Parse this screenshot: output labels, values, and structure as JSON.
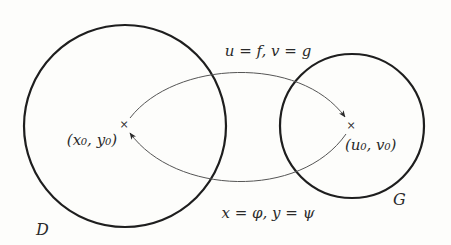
{
  "diagram": {
    "colors": {
      "background": "#fdfdfb",
      "stroke": "#1e1e1e",
      "arc": "#555555",
      "text": "#2a2a2a"
    },
    "regions": [
      {
        "id": "D",
        "label": "D",
        "cx": 125,
        "cy": 126,
        "r": 101
      },
      {
        "id": "G",
        "label": "G",
        "cx": 352,
        "cy": 126,
        "r": 72
      }
    ],
    "points": [
      {
        "id": "p0",
        "label": "(x₀,  y₀)",
        "x": 124,
        "y": 124
      },
      {
        "id": "q0",
        "label": "(u₀,  v₀)",
        "x": 351,
        "y": 125
      }
    ],
    "mappings": [
      {
        "id": "forward",
        "label": "u = f,  v = g",
        "from": "D",
        "to": "G"
      },
      {
        "id": "inverse",
        "label": "x = φ,  y = ψ",
        "from": "G",
        "to": "D"
      }
    ]
  }
}
